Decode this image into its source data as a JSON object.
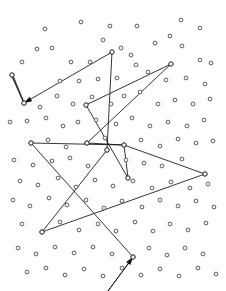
{
  "figure": {
    "type": "graph-plot",
    "width": 226,
    "height": 291,
    "background_color": "#ffffff",
    "node_color": "#ffffff",
    "node_stroke_color": "#4a4a4a",
    "edge_color": "#111111",
    "arrow_color": "#111111"
  },
  "chart_data": {
    "type": "scatter",
    "title": "",
    "xlabel": "",
    "ylabel": "",
    "xlim": [
      0,
      226
    ],
    "ylim": [
      0,
      291
    ],
    "grid": false,
    "legend": "none",
    "marker": "open-circle",
    "marker_size": 3,
    "points": [
      [
        45,
        29
      ],
      [
        81,
        22
      ],
      [
        110,
        26
      ],
      [
        137,
        26
      ],
      [
        181,
        20
      ],
      [
        200,
        28
      ],
      [
        22,
        62
      ],
      [
        37,
        49
      ],
      [
        52,
        48
      ],
      [
        71,
        62
      ],
      [
        90,
        62
      ],
      [
        103,
        40
      ],
      [
        121,
        48
      ],
      [
        136,
        65
      ],
      [
        155,
        43
      ],
      [
        170,
        36
      ],
      [
        182,
        46
      ],
      [
        200,
        60
      ],
      [
        211,
        63
      ],
      [
        12,
        75
      ],
      [
        60,
        81
      ],
      [
        79,
        81
      ],
      [
        98,
        79
      ],
      [
        117,
        78
      ],
      [
        131,
        55
      ],
      [
        148,
        72
      ],
      [
        166,
        80
      ],
      [
        186,
        78
      ],
      [
        205,
        84
      ],
      [
        24,
        103
      ],
      [
        40,
        107
      ],
      [
        57,
        96
      ],
      [
        73,
        104
      ],
      [
        92,
        97
      ],
      [
        111,
        104
      ],
      [
        124,
        96
      ],
      [
        140,
        92
      ],
      [
        158,
        104
      ],
      [
        175,
        100
      ],
      [
        193,
        104
      ],
      [
        210,
        99
      ],
      [
        10,
        122
      ],
      [
        27,
        121
      ],
      [
        46,
        118
      ],
      [
        63,
        126
      ],
      [
        78,
        122
      ],
      [
        96,
        120
      ],
      [
        116,
        124
      ],
      [
        132,
        118
      ],
      [
        150,
        126
      ],
      [
        168,
        122
      ],
      [
        187,
        126
      ],
      [
        204,
        120
      ],
      [
        31,
        143
      ],
      [
        48,
        140
      ],
      [
        66,
        147
      ],
      [
        87,
        143
      ],
      [
        105,
        138
      ],
      [
        124,
        145
      ],
      [
        141,
        140
      ],
      [
        160,
        146
      ],
      [
        178,
        139
      ],
      [
        196,
        143
      ],
      [
        213,
        141
      ],
      [
        14,
        160
      ],
      [
        33,
        165
      ],
      [
        52,
        161
      ],
      [
        70,
        158
      ],
      [
        88,
        166
      ],
      [
        107,
        150
      ],
      [
        126,
        160
      ],
      [
        144,
        163
      ],
      [
        162,
        166
      ],
      [
        182,
        159
      ],
      [
        205,
        174
      ],
      [
        20,
        181
      ],
      [
        38,
        185
      ],
      [
        58,
        178
      ],
      [
        76,
        187
      ],
      [
        95,
        180
      ],
      [
        113,
        186
      ],
      [
        133,
        181
      ],
      [
        152,
        188
      ],
      [
        171,
        182
      ],
      [
        190,
        188
      ],
      [
        208,
        184
      ],
      [
        13,
        200
      ],
      [
        30,
        206
      ],
      [
        49,
        198
      ],
      [
        67,
        205
      ],
      [
        86,
        200
      ],
      [
        104,
        208
      ],
      [
        122,
        201
      ],
      [
        142,
        207
      ],
      [
        160,
        200
      ],
      [
        178,
        206
      ],
      [
        196,
        201
      ],
      [
        214,
        207
      ],
      [
        42,
        232
      ],
      [
        22,
        224
      ],
      [
        60,
        222
      ],
      [
        79,
        230
      ],
      [
        98,
        224
      ],
      [
        116,
        231
      ],
      [
        135,
        222
      ],
      [
        153,
        231
      ],
      [
        170,
        224
      ],
      [
        188,
        230
      ],
      [
        206,
        223
      ],
      [
        18,
        248
      ],
      [
        36,
        254
      ],
      [
        55,
        247
      ],
      [
        74,
        253
      ],
      [
        93,
        247
      ],
      [
        112,
        254
      ],
      [
        133,
        257
      ],
      [
        149,
        248
      ],
      [
        167,
        255
      ],
      [
        185,
        248
      ],
      [
        203,
        254
      ],
      [
        27,
        272
      ],
      [
        46,
        268
      ],
      [
        65,
        275
      ],
      [
        84,
        269
      ],
      [
        103,
        276
      ],
      [
        122,
        268
      ],
      [
        141,
        275
      ],
      [
        160,
        269
      ],
      [
        179,
        276
      ],
      [
        198,
        268
      ],
      [
        216,
        274
      ]
    ],
    "tour_nodes": [
      {
        "id": "n-top-left-far",
        "x": 12,
        "y": 75
      },
      {
        "id": "n-arrow-target",
        "x": 24,
        "y": 103
      },
      {
        "id": "n-top-center",
        "x": 112,
        "y": 52
      },
      {
        "id": "n-top-right",
        "x": 171,
        "y": 64
      },
      {
        "id": "n-mid-left-a",
        "x": 86,
        "y": 105
      },
      {
        "id": "n-left-mid",
        "x": 31,
        "y": 143
      },
      {
        "id": "n-center-left",
        "x": 87,
        "y": 143
      },
      {
        "id": "n-center-right",
        "x": 124,
        "y": 145
      },
      {
        "id": "n-center-low",
        "x": 107,
        "y": 150
      },
      {
        "id": "n-right-far",
        "x": 205,
        "y": 174
      },
      {
        "id": "n-low-left",
        "x": 42,
        "y": 232
      },
      {
        "id": "n-low-center",
        "x": 133,
        "y": 257
      },
      {
        "id": "n-center-drop",
        "x": 128,
        "y": 178
      }
    ],
    "tour_edges": [
      {
        "from": "n-top-center",
        "to": "n-arrow-target",
        "arrow": "to"
      },
      {
        "from": "n-top-center",
        "to": "n-center-low",
        "arrow": "none"
      },
      {
        "from": "n-top-right",
        "to": "n-mid-left-a",
        "arrow": "none"
      },
      {
        "from": "n-top-right",
        "to": "n-center-left",
        "arrow": "none"
      },
      {
        "from": "n-mid-left-a",
        "to": "n-center-drop",
        "arrow": "none"
      },
      {
        "from": "n-left-mid",
        "to": "n-center-right",
        "arrow": "none"
      },
      {
        "from": "n-left-mid",
        "to": "n-low-center",
        "arrow": "none"
      },
      {
        "from": "n-center-left",
        "to": "n-center-right",
        "arrow": "none"
      },
      {
        "from": "n-center-right",
        "to": "n-right-far",
        "arrow": "none"
      },
      {
        "from": "n-center-right",
        "to": "n-center-drop",
        "arrow": "none"
      },
      {
        "from": "n-right-far",
        "to": "n-low-left",
        "arrow": "none"
      },
      {
        "from": "n-low-left",
        "to": "n-center-low",
        "arrow": "none"
      },
      {
        "from": "n-low-center",
        "to": "n-bottom-entry",
        "arrow": "from"
      }
    ],
    "edge_bundle": {
      "description": "bundle of near-parallel edges between top-left pair",
      "from": [
        12,
        75
      ],
      "to": [
        24,
        103
      ],
      "count": 5,
      "spread": 2.2
    },
    "arrows": [
      {
        "name": "arrow-into-left-node",
        "tip": [
          24,
          103
        ],
        "tail": [
          112,
          52
        ]
      },
      {
        "name": "arrow-into-bottom-node",
        "tip": [
          133,
          257
        ],
        "tail": [
          108,
          291
        ]
      }
    ],
    "counts": {
      "total_points": 130,
      "tour_nodes": 13,
      "tour_edges": 13,
      "arrowheads": 2
    }
  }
}
